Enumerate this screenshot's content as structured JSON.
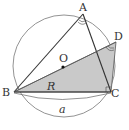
{
  "diagram": {
    "labels": {
      "A": "A",
      "B": "B",
      "C": "C",
      "D": "D",
      "O": "O",
      "R": "R",
      "a": "a"
    },
    "colors": {
      "stroke": "#333333",
      "circle": "#666666",
      "shade": "#c8c8c8"
    }
  }
}
